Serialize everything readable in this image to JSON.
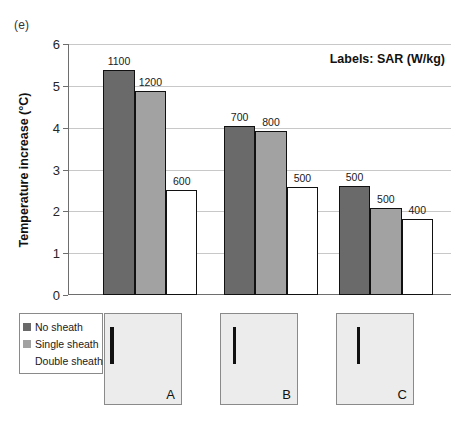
{
  "figure": {
    "panel_letter": "(e)",
    "note": "Labels: SAR (W/kg)"
  },
  "chart_data": {
    "type": "bar",
    "title": "",
    "note": "Labels: SAR (W/kg)",
    "xlabel": "",
    "ylabel": "Temperature increase (°C)",
    "ylim": [
      0,
      6
    ],
    "yticks": [
      0,
      1,
      2,
      3,
      4,
      5,
      6
    ],
    "ytick_labels": [
      "0",
      "1",
      "2",
      "3",
      "4",
      "5",
      "6"
    ],
    "grid": true,
    "legend_position": "bottom-left",
    "categories": [
      "A",
      "B",
      "C"
    ],
    "series": [
      {
        "name": "No sheath",
        "color": "#6a6a6a",
        "values": [
          5.38,
          4.04,
          2.6
        ],
        "labels": [
          "1100",
          "700",
          "500"
        ]
      },
      {
        "name": "Single sheath",
        "color": "#a2a2a2",
        "values": [
          4.88,
          3.91,
          2.07
        ],
        "labels": [
          "1200",
          "800",
          "500"
        ]
      },
      {
        "name": "Double sheath",
        "color": "#ffffff",
        "values": [
          2.52,
          2.59,
          1.82
        ],
        "labels": [
          "600",
          "500",
          "400"
        ]
      }
    ],
    "bar_label_unit": "SAR (W/kg)"
  },
  "legend": {
    "items": [
      {
        "label": "No sheath",
        "swatch": "c-dark"
      },
      {
        "label": "Single sheath",
        "swatch": "c-mid"
      },
      {
        "label": "Double sheath",
        "swatch": "c-white"
      }
    ]
  },
  "image_panels": [
    {
      "letter": "A",
      "line_left_pct": 6,
      "line_top_pct": 14,
      "line_height_pct": 42,
      "line_width": 4
    },
    {
      "letter": "B",
      "letter_dummy": "",
      "line_left_pct": 16,
      "line_top_pct": 14,
      "line_height_pct": 42,
      "line_width": 3
    },
    {
      "letter": "C",
      "line_left_pct": 26,
      "line_top_pct": 14,
      "line_height_pct": 42,
      "line_width": 3
    }
  ],
  "layout": {
    "group_centers_pct": [
      21.5,
      53.0,
      83.0
    ],
    "bar_width_pct": 8.2,
    "panel_lefts_px": [
      104,
      220,
      336
    ]
  }
}
